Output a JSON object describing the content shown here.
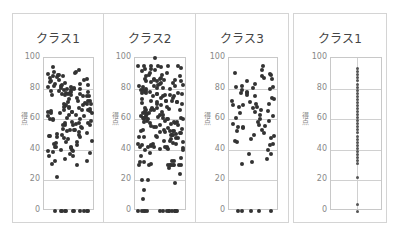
{
  "chart_data": [
    {
      "type": "scatter",
      "title": "クラス1",
      "ylabel": "得点",
      "ylim": [
        0,
        100
      ],
      "yticks": [
        0,
        20,
        40,
        60,
        80,
        100
      ],
      "grid": true,
      "jitter": true,
      "n_approx": 150,
      "values": [
        92,
        91,
        89,
        88,
        87,
        86,
        85,
        84,
        83,
        82,
        81,
        80,
        80,
        79,
        79,
        78,
        78,
        77,
        76,
        75,
        74,
        73,
        72,
        72,
        71,
        70,
        70,
        69,
        68,
        67,
        66,
        66,
        65,
        64,
        63,
        62,
        61,
        60,
        59,
        58,
        57,
        56,
        55,
        54,
        53,
        52,
        51,
        50,
        49,
        48,
        47,
        46,
        45,
        44,
        43,
        42,
        42,
        41,
        40,
        39,
        38,
        37,
        36,
        34,
        33,
        30,
        22,
        0,
        0,
        0,
        0,
        0,
        0,
        0,
        0,
        0,
        0,
        0
      ]
    },
    {
      "type": "scatter",
      "title": "クラス2",
      "ylabel": "得点",
      "ylim": [
        0,
        100
      ],
      "yticks": [
        0,
        20,
        40,
        60,
        80,
        100
      ],
      "grid": true,
      "jitter": true,
      "n_approx": 200,
      "values": [
        100,
        93,
        92,
        90,
        89,
        88,
        86,
        85,
        84,
        83,
        82,
        81,
        80,
        80,
        79,
        78,
        77,
        76,
        75,
        74,
        73,
        72,
        71,
        70,
        70,
        69,
        68,
        67,
        66,
        65,
        64,
        63,
        62,
        61,
        60,
        60,
        59,
        58,
        57,
        56,
        55,
        54,
        53,
        52,
        51,
        50,
        49,
        48,
        47,
        46,
        45,
        44,
        43,
        42,
        41,
        40,
        38,
        36,
        33,
        31,
        28,
        24,
        20,
        20,
        18,
        14,
        8,
        0,
        0,
        0,
        0,
        0,
        0,
        0,
        0,
        0,
        0,
        0,
        0,
        0,
        0,
        0
      ]
    },
    {
      "type": "scatter",
      "title": "クラス3",
      "ylabel": "得点",
      "ylim": [
        0,
        100
      ],
      "yticks": [
        0,
        20,
        40,
        60,
        80,
        100
      ],
      "grid": true,
      "jitter": true,
      "n_approx": 70,
      "values": [
        95,
        92,
        90,
        89,
        88,
        87,
        86,
        85,
        83,
        82,
        81,
        80,
        79,
        78,
        77,
        76,
        75,
        74,
        73,
        72,
        71,
        70,
        69,
        68,
        67,
        66,
        65,
        64,
        63,
        62,
        61,
        60,
        59,
        58,
        57,
        56,
        55,
        54,
        53,
        52,
        51,
        50,
        49,
        48,
        47,
        46,
        45,
        44,
        43,
        40,
        37,
        34,
        32,
        31,
        0,
        0,
        0,
        0,
        0
      ]
    },
    {
      "type": "scatter",
      "title": "クラス1",
      "ylabel": "得点",
      "ylim": [
        0,
        100
      ],
      "yticks": [
        0,
        20,
        40,
        60,
        80,
        100
      ],
      "grid": true,
      "jitter": false,
      "values": [
        93,
        91,
        89,
        87,
        85,
        83,
        81,
        79,
        77,
        75,
        73,
        71,
        69,
        67,
        65,
        63,
        61,
        59,
        57,
        55,
        53,
        51,
        49,
        47,
        45,
        43,
        41,
        39,
        37,
        35,
        33,
        31,
        22,
        4,
        0
      ]
    }
  ]
}
